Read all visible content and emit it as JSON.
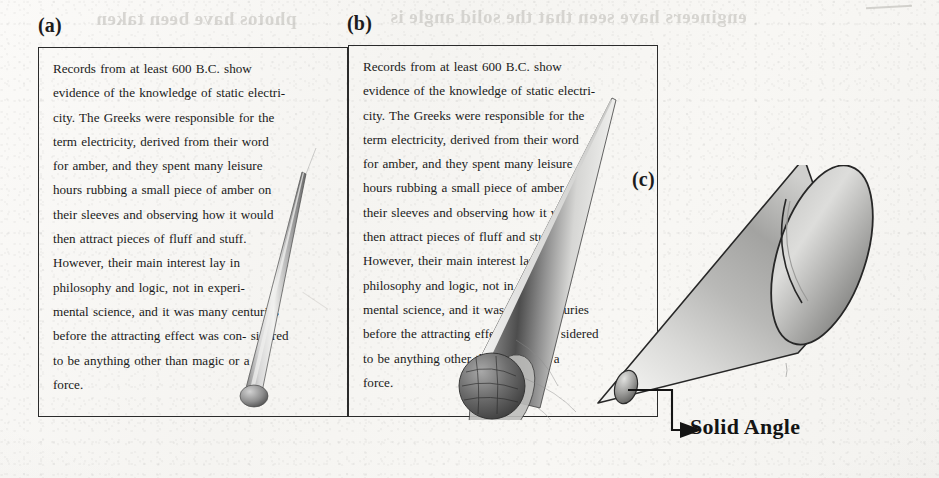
{
  "figure": {
    "caption_note": "Three panels illustrating increasing solid angle / field of view",
    "background_color": "#f7f6f3",
    "ink_color": "#1a1a1a",
    "border_color": "#2b2b2b"
  },
  "ghost_text": {
    "top_left": "photos have been taken",
    "top_right": "engineers have seen that the solid angle is"
  },
  "panels": [
    {
      "id": "a",
      "label": "(a)",
      "box": {
        "x": 38,
        "y": 47,
        "w": 310,
        "h": 370
      },
      "cone": {
        "type": "narrow-cone",
        "apex_x": 256,
        "apex_y": 404,
        "base_x": 300,
        "base_y": 182,
        "half_width": 9
      }
    },
    {
      "id": "b",
      "label": "(b)",
      "box": {
        "x": 348,
        "y": 45,
        "w": 310,
        "h": 372
      },
      "cone": {
        "type": "medium-cone",
        "apex_x": 612,
        "apex_y": 98,
        "base_x": 470,
        "base_y": 390,
        "half_width": 46
      }
    },
    {
      "id": "c",
      "label": "(c)",
      "cone": {
        "type": "wide-cone",
        "apex_x": 600,
        "apex_y": 402,
        "base_cx": 855,
        "base_cy": 272,
        "base_rx": 42,
        "base_ry": 86
      }
    }
  ],
  "body_text": {
    "full": "Records from at least 600 B.C. show evidence of the knowledge of static electricity. The Greeks were responsible for the term electricity, derived from their word for amber, and they spent many leisure hours rubbing a small piece of amber on their sleeves and observing how it would then attract pieces of fluff and stuff. However, their main interest lay in philosophy and logic, not in experimental science, and it was many centuries before the attracting effect was con- sidered to be anything other than magic or a force.",
    "lines": [
      "Records   from at least 600 B.C.   show",
      "evidence of the knowledge of static electri-",
      "city. The Greeks  were responsible  for the",
      "term   electricity,   derived from their word",
      "for amber, and  they  spent  many  leisure",
      "hours  rubbing  a small piece of amber on",
      "their sleeves and observing  how  it  would",
      "then  attract    pieces  of  fluff  and  stuff.",
      "However,   their   main   interest   lay  in",
      "philosophy   and   logic, not   in experi-",
      "mental  science, and it was many centuries",
      "before the attracting effect was con- sidered",
      "to be anything other than magic or a",
      "force."
    ]
  },
  "annotations": {
    "solid_angle_label": "Solid Angle",
    "leader_arrow": "arrow pointing right to the small ellipse cross-section at the cone apex"
  }
}
